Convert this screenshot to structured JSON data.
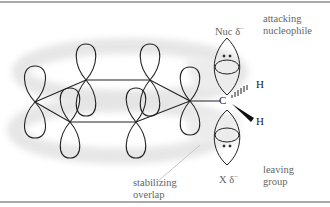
{
  "figure": {
    "labels": {
      "nucleophile_symbol": "Nuc",
      "nucleophile_charge": "δ",
      "nucleophile_charge_sign": "−",
      "attacking_line1": "attacking",
      "attacking_line2": "nucleophile",
      "leaving_symbol": "X",
      "leaving_charge": "δ",
      "leaving_charge_sign": "−",
      "leaving_line1": "leaving",
      "leaving_line2": "group",
      "stabilizing_line1": "stabilizing",
      "stabilizing_line2": "overlap",
      "carbon": "C",
      "hydrogen_top": "H",
      "hydrogen_bottom": "H"
    },
    "colors": {
      "line": "#222222",
      "ring_shadow": "#e6e6e6",
      "label_text": "#666666",
      "rule": "#a9a9a9"
    }
  }
}
